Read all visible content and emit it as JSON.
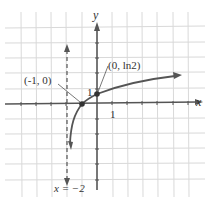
{
  "graph": {
    "function": "y = ln(x + 2)",
    "grid": {
      "x_min": -5,
      "x_max": 6,
      "y_min": -6,
      "y_max": 6,
      "spacing_px": 15.2
    },
    "axes": {
      "x_label": "x",
      "y_label": "y",
      "x_tick_label": "1",
      "y_tick_label": "1"
    },
    "points": [
      {
        "label": "(-1, 0)",
        "x": -1,
        "y": 0
      },
      {
        "label": "(0, ln2)",
        "x": 0,
        "y": 0.693
      }
    ],
    "asymptote": {
      "label": "x = −2",
      "x": -2
    },
    "colors": {
      "grid": "#d9d9d9",
      "axis": "#555555",
      "curve": "#555555",
      "point": "#333333"
    }
  }
}
